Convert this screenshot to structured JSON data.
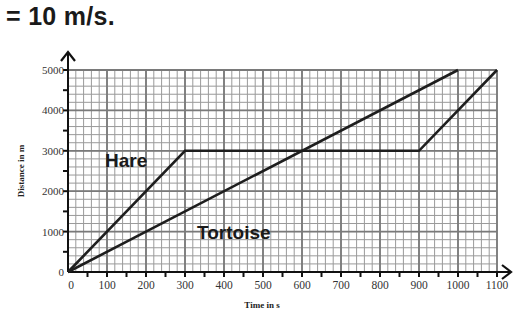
{
  "heading": "= 10 m/s.",
  "chart_data": {
    "type": "line",
    "title": "",
    "xlabel": "Time in s",
    "ylabel": "Distance in m",
    "xlim": [
      0,
      1100
    ],
    "ylim": [
      0,
      5000
    ],
    "x_ticks": [
      "0",
      "100",
      "200",
      "300",
      "400",
      "500",
      "600",
      "700",
      "800",
      "900",
      "1000",
      "1100"
    ],
    "y_ticks": [
      "0",
      "1000",
      "2000",
      "3000",
      "4000",
      "5000"
    ],
    "grid": true,
    "legend": "inline labels",
    "series": [
      {
        "name": "Hare",
        "points": [
          [
            0,
            0
          ],
          [
            300,
            3000
          ],
          [
            900,
            3000
          ],
          [
            1100,
            5000
          ]
        ]
      },
      {
        "name": "Tortoise",
        "points": [
          [
            0,
            0
          ],
          [
            1000,
            5000
          ]
        ]
      }
    ]
  }
}
